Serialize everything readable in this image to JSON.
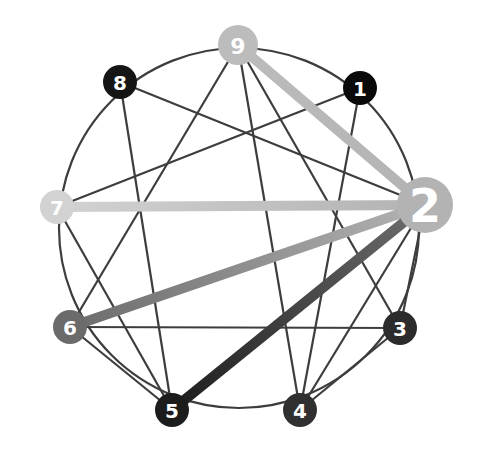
{
  "diagram": {
    "type": "enneagram",
    "focus_point": "2",
    "points": [
      {
        "id": "1",
        "label": "1",
        "color": "#0a0a0a"
      },
      {
        "id": "2",
        "label": "2",
        "color": "#b3b3b3"
      },
      {
        "id": "3",
        "label": "3",
        "color": "#2b2b2b"
      },
      {
        "id": "4",
        "label": "4",
        "color": "#303030"
      },
      {
        "id": "5",
        "label": "5",
        "color": "#1c1c1c"
      },
      {
        "id": "6",
        "label": "6",
        "color": "#6b6b6b"
      },
      {
        "id": "7",
        "label": "7",
        "color": "#d2d2d2"
      },
      {
        "id": "8",
        "label": "8",
        "color": "#151515"
      },
      {
        "id": "9",
        "label": "9",
        "color": "#bcbcbc"
      }
    ],
    "thin_lines": [
      [
        "9",
        "4"
      ],
      [
        "9",
        "6"
      ],
      [
        "9",
        "3"
      ],
      [
        "8",
        "2"
      ],
      [
        "8",
        "5"
      ],
      [
        "1",
        "7"
      ],
      [
        "1",
        "4"
      ],
      [
        "7",
        "5"
      ],
      [
        "6",
        "3"
      ],
      [
        "6",
        "5"
      ],
      [
        "3",
        "4"
      ],
      [
        "4",
        "2"
      ],
      [
        "3",
        "2"
      ]
    ],
    "highlighted_connections": [
      {
        "from": "2",
        "to": "9",
        "color_from": "#b3b3b3",
        "color_to": "#bcbcbc"
      },
      {
        "from": "2",
        "to": "7",
        "color_from": "#b3b3b3",
        "color_to": "#d2d2d2"
      },
      {
        "from": "2",
        "to": "6",
        "color_from": "#b3b3b3",
        "color_to": "#6b6b6b"
      },
      {
        "from": "2",
        "to": "5",
        "color_from": "#6e6e6e",
        "color_to": "#1c1c1c"
      }
    ],
    "line_color": "#3d3d3d"
  }
}
